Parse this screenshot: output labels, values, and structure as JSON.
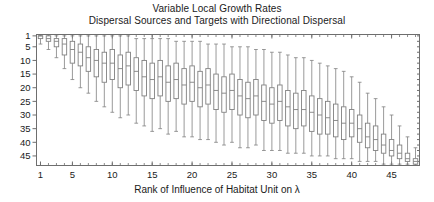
{
  "chart_data": {
    "type": "box",
    "title": "Variable Local Growth Rates",
    "subtitle": "Dispersal Sources and Targets with Directional Dispersal",
    "title_lines": [
      "Variable Local Growth Rates",
      "Dispersal Sources and Targets with Directional Dispersal"
    ],
    "xlabel": "Rank of Influence of Habitat Unit on λ",
    "ylabel": "",
    "xlim": [
      0.5,
      48.5
    ],
    "ylim": [
      48.5,
      0.5
    ],
    "y_inverted": true,
    "grid": false,
    "legend": null,
    "box_fill": "#ffffff",
    "line_color": "#808080",
    "axis_color": "#6e6e6e",
    "xticks": [
      1,
      5,
      10,
      15,
      20,
      25,
      30,
      35,
      40,
      45
    ],
    "xticklabels": [
      "1",
      "5",
      "10",
      "15",
      "20",
      "25",
      "30",
      "35",
      "40",
      "45"
    ],
    "yticks": [
      1,
      5,
      10,
      15,
      20,
      25,
      30,
      35,
      40,
      45
    ],
    "yticklabels": [
      "1",
      "5",
      "10",
      "15",
      "20",
      "25",
      "30",
      "35",
      "40",
      "45"
    ],
    "n_boxes": 48,
    "box_stats_fields": [
      "x",
      "whisker_low",
      "q1",
      "median",
      "q3",
      "whisker_high"
    ],
    "boxes": [
      {
        "x": 1,
        "whisker_low": 1,
        "q1": 1,
        "median": 1,
        "q3": 2,
        "whisker_high": 4
      },
      {
        "x": 2,
        "whisker_low": 1,
        "q1": 1,
        "median": 2,
        "q3": 3,
        "whisker_high": 6
      },
      {
        "x": 3,
        "whisker_low": 1,
        "q1": 2,
        "median": 3,
        "q3": 5,
        "whisker_high": 9
      },
      {
        "x": 4,
        "whisker_low": 1,
        "q1": 2,
        "median": 4,
        "q3": 8,
        "whisker_high": 13
      },
      {
        "x": 5,
        "whisker_low": 1,
        "q1": 3,
        "median": 6,
        "q3": 11,
        "whisker_high": 17
      },
      {
        "x": 6,
        "whisker_low": 1,
        "q1": 4,
        "median": 7,
        "q3": 12,
        "whisker_high": 20
      },
      {
        "x": 7,
        "whisker_low": 1,
        "q1": 5,
        "median": 9,
        "q3": 14,
        "whisker_high": 22
      },
      {
        "x": 8,
        "whisker_low": 1,
        "q1": 6,
        "median": 10,
        "q3": 16,
        "whisker_high": 25
      },
      {
        "x": 9,
        "whisker_low": 1,
        "q1": 7,
        "median": 11,
        "q3": 18,
        "whisker_high": 27
      },
      {
        "x": 10,
        "whisker_low": 1,
        "q1": 6,
        "median": 11,
        "q3": 17,
        "whisker_high": 29
      },
      {
        "x": 11,
        "whisker_low": 1,
        "q1": 8,
        "median": 13,
        "q3": 20,
        "whisker_high": 31
      },
      {
        "x": 12,
        "whisker_low": 1,
        "q1": 7,
        "median": 12,
        "q3": 19,
        "whisker_high": 30
      },
      {
        "x": 13,
        "whisker_low": 2,
        "q1": 9,
        "median": 14,
        "q3": 21,
        "whisker_high": 33
      },
      {
        "x": 14,
        "whisker_low": 2,
        "q1": 10,
        "median": 16,
        "q3": 23,
        "whisker_high": 34
      },
      {
        "x": 15,
        "whisker_low": 2,
        "q1": 11,
        "median": 17,
        "q3": 24,
        "whisker_high": 36
      },
      {
        "x": 16,
        "whisker_low": 2,
        "q1": 10,
        "median": 16,
        "q3": 23,
        "whisker_high": 35
      },
      {
        "x": 17,
        "whisker_low": 2,
        "q1": 12,
        "median": 18,
        "q3": 25,
        "whisker_high": 37
      },
      {
        "x": 18,
        "whisker_low": 3,
        "q1": 11,
        "median": 17,
        "q3": 24,
        "whisker_high": 36
      },
      {
        "x": 19,
        "whisker_low": 3,
        "q1": 13,
        "median": 19,
        "q3": 26,
        "whisker_high": 38
      },
      {
        "x": 20,
        "whisker_low": 3,
        "q1": 12,
        "median": 18,
        "q3": 25,
        "whisker_high": 38
      },
      {
        "x": 21,
        "whisker_low": 3,
        "q1": 14,
        "median": 20,
        "q3": 27,
        "whisker_high": 39
      },
      {
        "x": 22,
        "whisker_low": 4,
        "q1": 13,
        "median": 19,
        "q3": 26,
        "whisker_high": 39
      },
      {
        "x": 23,
        "whisker_low": 4,
        "q1": 15,
        "median": 21,
        "q3": 28,
        "whisker_high": 40
      },
      {
        "x": 24,
        "whisker_low": 4,
        "q1": 16,
        "median": 22,
        "q3": 29,
        "whisker_high": 41
      },
      {
        "x": 25,
        "whisker_low": 5,
        "q1": 15,
        "median": 21,
        "q3": 28,
        "whisker_high": 40
      },
      {
        "x": 26,
        "whisker_low": 5,
        "q1": 17,
        "median": 23,
        "q3": 30,
        "whisker_high": 42
      },
      {
        "x": 27,
        "whisker_low": 5,
        "q1": 18,
        "median": 24,
        "q3": 31,
        "whisker_high": 42
      },
      {
        "x": 28,
        "whisker_low": 6,
        "q1": 17,
        "median": 23,
        "q3": 30,
        "whisker_high": 41
      },
      {
        "x": 29,
        "whisker_low": 6,
        "q1": 19,
        "median": 25,
        "q3": 32,
        "whisker_high": 43
      },
      {
        "x": 30,
        "whisker_low": 7,
        "q1": 20,
        "median": 26,
        "q3": 33,
        "whisker_high": 43
      },
      {
        "x": 31,
        "whisker_low": 7,
        "q1": 19,
        "median": 25,
        "q3": 32,
        "whisker_high": 43
      },
      {
        "x": 32,
        "whisker_low": 8,
        "q1": 21,
        "median": 27,
        "q3": 34,
        "whisker_high": 44
      },
      {
        "x": 33,
        "whisker_low": 9,
        "q1": 22,
        "median": 28,
        "q3": 35,
        "whisker_high": 44
      },
      {
        "x": 34,
        "whisker_low": 9,
        "q1": 21,
        "median": 28,
        "q3": 34,
        "whisker_high": 44
      },
      {
        "x": 35,
        "whisker_low": 10,
        "q1": 23,
        "median": 29,
        "q3": 36,
        "whisker_high": 45
      },
      {
        "x": 36,
        "whisker_low": 11,
        "q1": 24,
        "median": 30,
        "q3": 37,
        "whisker_high": 45
      },
      {
        "x": 37,
        "whisker_low": 12,
        "q1": 25,
        "median": 31,
        "q3": 37,
        "whisker_high": 45
      },
      {
        "x": 38,
        "whisker_low": 13,
        "q1": 26,
        "median": 32,
        "q3": 38,
        "whisker_high": 46
      },
      {
        "x": 39,
        "whisker_low": 14,
        "q1": 27,
        "median": 33,
        "q3": 39,
        "whisker_high": 46
      },
      {
        "x": 40,
        "whisker_low": 16,
        "q1": 28,
        "median": 33,
        "q3": 38,
        "whisker_high": 46
      },
      {
        "x": 41,
        "whisker_low": 18,
        "q1": 30,
        "median": 35,
        "q3": 40,
        "whisker_high": 47
      },
      {
        "x": 42,
        "whisker_low": 22,
        "q1": 33,
        "median": 38,
        "q3": 42,
        "whisker_high": 47
      },
      {
        "x": 43,
        "whisker_low": 24,
        "q1": 34,
        "median": 39,
        "q3": 43,
        "whisker_high": 47
      },
      {
        "x": 44,
        "whisker_low": 27,
        "q1": 37,
        "median": 41,
        "q3": 44,
        "whisker_high": 48
      },
      {
        "x": 45,
        "whisker_low": 30,
        "q1": 39,
        "median": 43,
        "q3": 45,
        "whisker_high": 48
      },
      {
        "x": 46,
        "whisker_low": 34,
        "q1": 41,
        "median": 44,
        "q3": 46,
        "whisker_high": 48
      },
      {
        "x": 47,
        "whisker_low": 38,
        "q1": 44,
        "median": 46,
        "q3": 47,
        "whisker_high": 48
      },
      {
        "x": 48,
        "whisker_low": 42,
        "q1": 46,
        "median": 47,
        "q3": 48,
        "whisker_high": 48
      }
    ]
  }
}
